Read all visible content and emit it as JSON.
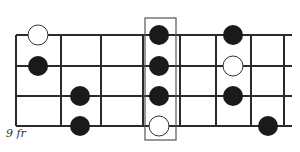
{
  "diagram": {
    "fret_label": "9 fr",
    "colors": {
      "line": "#2a2a2a",
      "filled_dot": "#1a1a1a",
      "open_dot_fill": "#ffffff",
      "open_dot_stroke": "#333333",
      "highlight_box": "#555555"
    },
    "strings_y": [
      35,
      66,
      96,
      126
    ],
    "string_x_range": [
      16,
      292
    ],
    "frets_x": [
      16,
      61,
      101,
      143,
      180,
      216,
      251,
      284
    ],
    "highlight_box": {
      "x": 145,
      "y": 18,
      "width": 31,
      "height": 122
    },
    "dots": [
      {
        "string": 1,
        "x": 38,
        "type": "open"
      },
      {
        "string": 2,
        "x": 38,
        "type": "filled"
      },
      {
        "string": 3,
        "x": 80,
        "type": "filled"
      },
      {
        "string": 4,
        "x": 80,
        "type": "filled"
      },
      {
        "string": 1,
        "x": 159,
        "type": "filled"
      },
      {
        "string": 2,
        "x": 159,
        "type": "filled"
      },
      {
        "string": 3,
        "x": 159,
        "type": "filled"
      },
      {
        "string": 4,
        "x": 159,
        "type": "open"
      },
      {
        "string": 1,
        "x": 233,
        "type": "filled"
      },
      {
        "string": 2,
        "x": 233,
        "type": "open"
      },
      {
        "string": 3,
        "x": 233,
        "type": "filled"
      },
      {
        "string": 4,
        "x": 268,
        "type": "filled"
      }
    ],
    "dot_radius": 10
  }
}
